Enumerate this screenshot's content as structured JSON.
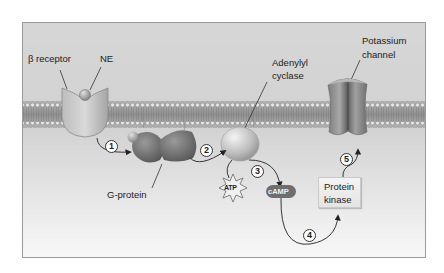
{
  "diagram": {
    "title": "",
    "labels": {
      "beta_receptor": "β receptor",
      "ne": "NE",
      "adenylyl_cyclase_line1": "Adenylyl",
      "adenylyl_cyclase_line2": "cyclase",
      "potassium_channel_line1": "Potassium",
      "potassium_channel_line2": "channel",
      "g_protein": "G-protein",
      "atp": "ATP",
      "camp": "cAMP",
      "protein_kinase_line1": "Protein",
      "protein_kinase_line2": "kinase"
    },
    "steps": [
      "1",
      "2",
      "3",
      "4",
      "5"
    ],
    "flow": [
      {
        "step": "1",
        "from": "β receptor",
        "to": "G-protein"
      },
      {
        "step": "2",
        "from": "G-protein",
        "to": "Adenylyl cyclase"
      },
      {
        "step": "3",
        "from": "ATP",
        "to": "cAMP",
        "via": "Adenylyl cyclase"
      },
      {
        "step": "4",
        "from": "cAMP",
        "to": "Protein kinase"
      },
      {
        "step": "5",
        "from": "Protein kinase",
        "to": "Potassium channel"
      }
    ],
    "colors": {
      "background_top": "#d8d8d8",
      "background_bottom": "#f7f7f7",
      "membrane": "#a9a9a9",
      "protein": "#8a8a8a",
      "camp_fill": "#6e6e6e",
      "frame": "#9a9a9a"
    }
  }
}
